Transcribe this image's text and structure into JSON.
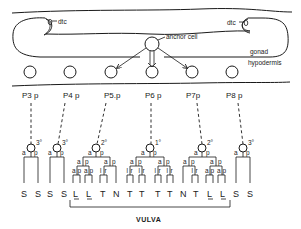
{
  "figure": {
    "labels": {
      "dtc_left": "dtc",
      "dtc_right": "dtc",
      "anchor_cell": "anchor cell",
      "gonad": "gonad",
      "hypodermis": "hypodermis",
      "vulva": "VULVA"
    },
    "cells": [
      {
        "name": "P3.p",
        "label": "P3 p",
        "fate": "3°"
      },
      {
        "name": "P4.p",
        "label": "P4 p",
        "fate": "3°"
      },
      {
        "name": "P5.p",
        "label": "P5.p",
        "fate": "2°"
      },
      {
        "name": "P6.p",
        "label": "P6 p",
        "fate": "1°"
      },
      {
        "name": "P7.p",
        "label": "P7p",
        "fate": "2°"
      },
      {
        "name": "P8.p",
        "label": "P8 p",
        "fate": "3°"
      }
    ],
    "division_labels": {
      "a": "a",
      "p": "p",
      "l": "l",
      "r": "r"
    },
    "terminal_fates": [
      "S",
      "S",
      "S",
      "S",
      "L",
      "L",
      "T",
      "N",
      "T",
      "T",
      "T",
      "T",
      "N",
      "T",
      "L",
      "L",
      "S",
      "S"
    ]
  }
}
